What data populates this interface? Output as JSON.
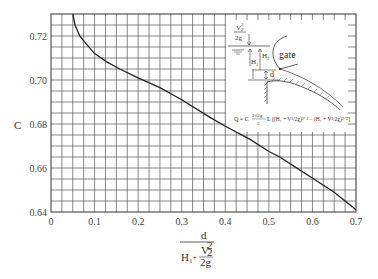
{
  "chart_data": {
    "type": "line",
    "title": "",
    "xlabel": "d / (H1 + V2^2/2g)",
    "ylabel": "C",
    "xlim": [
      0,
      0.7
    ],
    "ylim": [
      0.64,
      0.73
    ],
    "grid": true,
    "grid_minor_x": 0.025,
    "grid_minor_y": 0.005,
    "x_ticks": [
      "0",
      "0.1",
      "0.2",
      "0.3",
      "0.4",
      "0.5",
      "0.6",
      "0.7"
    ],
    "y_ticks": [
      "0.64",
      "0.66",
      "0.68",
      "0.70",
      "0.72"
    ],
    "series": [
      {
        "name": "C",
        "x": [
          0.05,
          0.055,
          0.066,
          0.08,
          0.1,
          0.13,
          0.158,
          0.2,
          0.25,
          0.3,
          0.365,
          0.4,
          0.457,
          0.5,
          0.525,
          0.56,
          0.595,
          0.65,
          0.7
        ],
        "y": [
          0.73,
          0.725,
          0.72,
          0.7165,
          0.712,
          0.708,
          0.705,
          0.701,
          0.6965,
          0.691,
          0.683,
          0.679,
          0.673,
          0.6675,
          0.665,
          0.6605,
          0.656,
          0.649,
          0.641
        ]
      }
    ],
    "annotations": {
      "inset_labels": [
        "V2²/2g",
        "H1",
        "H2",
        "d",
        "gate"
      ],
      "formula": "Q = C (2√(2g)/3) L [ (H1 + V²/2g)^(3/2) − (H1 + V²/2g)^(3/2) ]"
    }
  },
  "axes": {
    "y_label": "C",
    "x_label_num": "d",
    "x_label_den_left": "H",
    "x_label_den_sub": "1",
    "x_label_den_plus": "+",
    "x_label_den_frac_num": "V",
    "x_label_den_frac_num_sup": "2",
    "x_label_den_frac_num_sub": "2",
    "x_label_den_frac_den": "2g"
  },
  "inset": {
    "head_label_num": "V",
    "head_label_sup": "2",
    "head_label_sub": "2",
    "head_label_den": "2g",
    "h1": "H",
    "h1_sub": "1",
    "h2": "H",
    "h2_sub": "2",
    "d": "d",
    "gate": "gate",
    "formula_lhs": "Q = C",
    "formula_coef_num": "2√2g",
    "formula_coef_den": "3",
    "formula_L": "L",
    "formula_body": "[(H₁ + V²/2g)³ᐟ² − (H₁ + V²/2g)³ᐟ²]"
  }
}
